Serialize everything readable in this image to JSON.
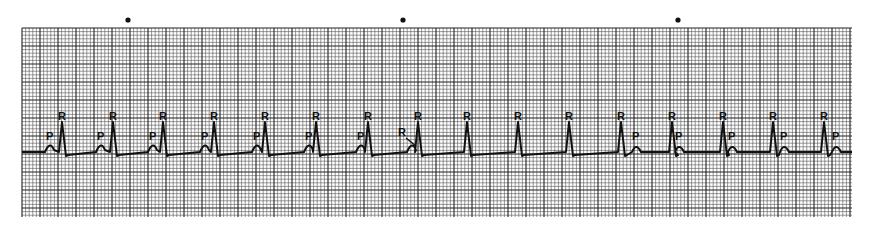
{
  "strip": {
    "type": "ecg_rhythm_strip",
    "grid": {
      "left": 22,
      "top": 28,
      "right": 852,
      "bottom": 217,
      "minor": 3.6,
      "major": 18,
      "color": "#222222"
    },
    "baseline_y": 152,
    "time_markers_x": [
      128,
      403,
      678
    ],
    "beats": [
      {
        "r_x": 62,
        "p_x": 50,
        "p_pos": "before",
        "r_label": "R",
        "p_label": "P"
      },
      {
        "r_x": 113,
        "p_x": 101,
        "p_pos": "before",
        "r_label": "R",
        "p_label": "P"
      },
      {
        "r_x": 163,
        "p_x": 153,
        "p_pos": "before",
        "r_label": "R",
        "p_label": "P"
      },
      {
        "r_x": 214,
        "p_x": 205,
        "p_pos": "before",
        "r_label": "R",
        "p_label": "P"
      },
      {
        "r_x": 265,
        "p_x": 257,
        "p_pos": "before",
        "r_label": "R",
        "p_label": "P"
      },
      {
        "r_x": 316,
        "p_x": 309,
        "p_pos": "before",
        "r_label": "R",
        "p_label": "P"
      },
      {
        "r_x": 368,
        "p_x": 361,
        "p_pos": "before",
        "r_label": "R",
        "p_label": "P"
      },
      {
        "r_x": 418,
        "p_x": 402,
        "p_pos": "arrow",
        "r_label": "R",
        "p_label": "R"
      },
      {
        "r_x": 467,
        "p_x": null,
        "p_pos": "none",
        "r_label": "R",
        "p_label": ""
      },
      {
        "r_x": 518,
        "p_x": null,
        "p_pos": "none",
        "r_label": "R",
        "p_label": ""
      },
      {
        "r_x": 569,
        "p_x": null,
        "p_pos": "none",
        "r_label": "R",
        "p_label": ""
      },
      {
        "r_x": 621,
        "p_x": 636,
        "p_pos": "after",
        "r_label": "R",
        "p_label": "P"
      },
      {
        "r_x": 672,
        "p_x": 679,
        "p_pos": "after",
        "r_label": "R",
        "p_label": "P"
      },
      {
        "r_x": 723,
        "p_x": 732,
        "p_pos": "after",
        "r_label": "R",
        "p_label": "P"
      },
      {
        "r_x": 773,
        "p_x": 784,
        "p_pos": "after",
        "r_label": "R",
        "p_label": "P"
      },
      {
        "r_x": 824,
        "p_x": 836,
        "p_pos": "after",
        "r_label": "R",
        "p_label": "P"
      }
    ]
  }
}
